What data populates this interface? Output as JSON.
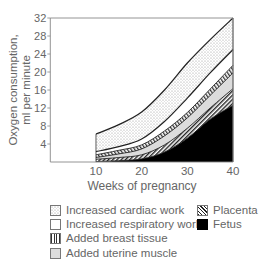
{
  "chart_data": {
    "type": "area",
    "stacked": true,
    "title": "",
    "xlabel": "Weeks of pregnancy",
    "ylabel": "Oxygen consumption, ml per minute",
    "ylabel_line1": "Oxygen consumption,",
    "ylabel_line2": "ml per minute",
    "xlim": [
      0,
      40
    ],
    "ylim": [
      0,
      32
    ],
    "x_ticks": [
      10,
      20,
      30,
      40
    ],
    "y_ticks": [
      4,
      8,
      12,
      16,
      20,
      24,
      28,
      32
    ],
    "x": [
      10,
      15,
      20,
      25,
      30,
      35,
      40
    ],
    "cumulative_boundaries": {
      "fetus_top": [
        0.1,
        0.3,
        0.7,
        2.2,
        5.3,
        9.5,
        12.6
      ],
      "placenta_top": [
        0.6,
        1.0,
        1.6,
        3.8,
        7.5,
        12.0,
        16.3
      ],
      "uterine_top": [
        1.0,
        1.8,
        2.9,
        5.8,
        9.8,
        14.8,
        19.8
      ],
      "breast_top": [
        1.6,
        2.6,
        3.8,
        6.9,
        11.0,
        16.2,
        21.5
      ],
      "respiratory_top": [
        2.3,
        3.4,
        5.1,
        9.0,
        14.2,
        19.8,
        25.0
      ],
      "cardiac_top": [
        6.2,
        8.3,
        11.1,
        16.0,
        22.0,
        27.2,
        32.0
      ]
    },
    "series": [
      {
        "name": "Fetus",
        "values": [
          0.1,
          0.3,
          0.7,
          2.2,
          5.3,
          9.5,
          12.6
        ]
      },
      {
        "name": "Placenta",
        "values": [
          0.5,
          0.7,
          0.9,
          1.6,
          2.2,
          2.5,
          3.7
        ]
      },
      {
        "name": "Added uterine muscle",
        "values": [
          0.4,
          0.8,
          1.3,
          2.0,
          2.3,
          2.8,
          3.5
        ]
      },
      {
        "name": "Added breast tissue",
        "values": [
          0.6,
          0.8,
          0.9,
          1.1,
          1.2,
          1.4,
          1.7
        ]
      },
      {
        "name": "Increased respiratory work",
        "values": [
          0.7,
          0.8,
          1.3,
          2.1,
          3.2,
          3.6,
          3.5
        ]
      },
      {
        "name": "Increased cardiac work",
        "values": [
          3.9,
          4.9,
          6.0,
          7.0,
          7.8,
          7.4,
          7.0
        ]
      }
    ],
    "legend_position": "bottom",
    "grid": false
  },
  "legend": {
    "items": [
      {
        "label": "Increased cardiac work",
        "pattern": "dots"
      },
      {
        "label": "Increased respiratory work",
        "pattern": "blank"
      },
      {
        "label": "Added breast tissue",
        "pattern": "vertical-lines"
      },
      {
        "label": "Added uterine muscle",
        "pattern": "light-grey"
      },
      {
        "label": "Placenta",
        "pattern": "diagonal-hatch"
      },
      {
        "label": "Fetus",
        "pattern": "solid-black"
      }
    ]
  },
  "colors": {
    "axis": "#888888",
    "text": "#666666",
    "fetus": "#000000",
    "uterine": "#dcdcdc",
    "line": "#222222"
  }
}
